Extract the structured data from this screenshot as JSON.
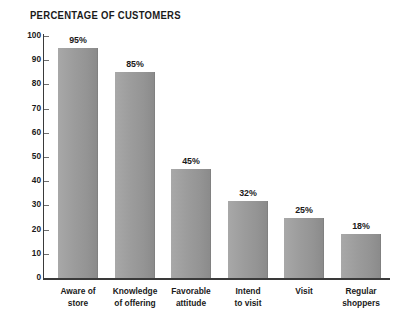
{
  "chart_data": {
    "type": "bar",
    "title": "PERCENTAGE OF CUSTOMERS",
    "xlabel": "",
    "ylabel": "",
    "ylim": [
      0,
      100
    ],
    "ytick_step": 10,
    "grid": false,
    "legend": null,
    "categories": [
      "Aware of\nstore",
      "Knowledge\nof offering",
      "Favorable\nattitude",
      "Intend\nto visit",
      "Visit",
      "Regular\nshoppers"
    ],
    "values": [
      95,
      85,
      45,
      32,
      25,
      18
    ],
    "value_labels": [
      "95%",
      "85%",
      "45%",
      "32%",
      "25%",
      "18%"
    ],
    "ytick_labels": [
      "100",
      "90",
      "80",
      "70",
      "60",
      "50",
      "40",
      "30",
      "20",
      "10",
      "0"
    ],
    "ytick_values": [
      100,
      90,
      80,
      70,
      60,
      50,
      40,
      30,
      20,
      10,
      0
    ],
    "colors": {
      "bar_light": "#a8a8a8",
      "bar_dark": "#8a8a8a",
      "axis": "#3a3a3a",
      "text": "#1a1a1a",
      "background": "#ffffff"
    }
  }
}
